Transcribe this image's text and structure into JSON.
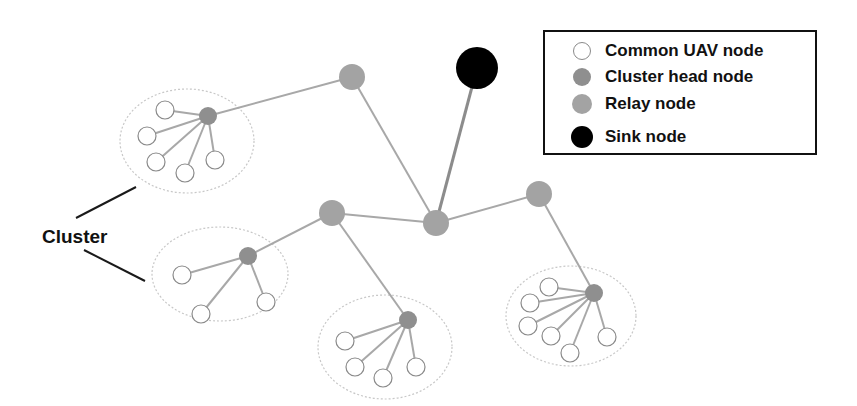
{
  "colors": {
    "common_fill": "#ffffff",
    "common_stroke": "#8a8a8a",
    "head_fill": "#8f8f8f",
    "relay_fill": "#a3a3a3",
    "sink_fill": "#000000",
    "link": "#a8a8a8",
    "sink_link": "#8c8c8c",
    "ellipse": "#c8c8c8",
    "pointer": "#1a1a1a"
  },
  "legend": {
    "items": [
      {
        "label": "Common UAV node",
        "type": "common",
        "y": 7
      },
      {
        "label": "Cluster head node",
        "type": "head",
        "y": 33
      },
      {
        "label": "Relay node",
        "type": "relay",
        "y": 60
      },
      {
        "label": "Sink node",
        "type": "sink",
        "y": 93
      }
    ]
  },
  "cluster_label": {
    "text": "Cluster",
    "pointers": [
      {
        "x1": 76,
        "y1": 218,
        "x2": 136,
        "y2": 187
      },
      {
        "x1": 84,
        "y1": 250,
        "x2": 145,
        "y2": 281
      }
    ]
  },
  "sink": {
    "x": 477,
    "y": 68,
    "r": 21
  },
  "relays": [
    {
      "id": "R1",
      "x": 352,
      "y": 77,
      "r": 13
    },
    {
      "id": "R2",
      "x": 332,
      "y": 213,
      "r": 13
    },
    {
      "id": "R3",
      "x": 436,
      "y": 223,
      "r": 13
    },
    {
      "id": "R4",
      "x": 539,
      "y": 194,
      "r": 13
    }
  ],
  "backbone_links": [
    {
      "from": "R3",
      "to": "sink",
      "sink": true
    },
    {
      "from": "R3",
      "to": "R1"
    },
    {
      "from": "R3",
      "to": "R2"
    },
    {
      "from": "R3",
      "to": "R4"
    },
    {
      "from": "C1",
      "to": "R1"
    },
    {
      "from": "C2",
      "to": "R2"
    },
    {
      "from": "C3",
      "to": "R2"
    },
    {
      "from": "C4",
      "to": "R4"
    }
  ],
  "clusters": [
    {
      "id": "C1",
      "ellipse": {
        "cx": 187,
        "cy": 141,
        "rx": 67,
        "ry": 52
      },
      "head": {
        "x": 208,
        "y": 116,
        "r": 9
      },
      "members": [
        {
          "x": 165,
          "y": 110
        },
        {
          "x": 147,
          "y": 136
        },
        {
          "x": 156,
          "y": 162
        },
        {
          "x": 185,
          "y": 173
        },
        {
          "x": 215,
          "y": 160
        }
      ]
    },
    {
      "id": "C2",
      "ellipse": {
        "cx": 220,
        "cy": 274,
        "rx": 68,
        "ry": 47
      },
      "head": {
        "x": 248,
        "y": 256,
        "r": 9
      },
      "members": [
        {
          "x": 182,
          "y": 275
        },
        {
          "x": 201,
          "y": 314
        },
        {
          "x": 266,
          "y": 302
        }
      ]
    },
    {
      "id": "C3",
      "ellipse": {
        "cx": 385,
        "cy": 347,
        "rx": 67,
        "ry": 52
      },
      "head": {
        "x": 408,
        "y": 320,
        "r": 9
      },
      "members": [
        {
          "x": 345,
          "y": 341
        },
        {
          "x": 355,
          "y": 367
        },
        {
          "x": 383,
          "y": 378
        },
        {
          "x": 416,
          "y": 367
        }
      ]
    },
    {
      "id": "C4",
      "ellipse": {
        "cx": 571,
        "cy": 316,
        "rx": 65,
        "ry": 50
      },
      "head": {
        "x": 594,
        "y": 293,
        "r": 9
      },
      "members": [
        {
          "x": 549,
          "y": 287
        },
        {
          "x": 530,
          "y": 303
        },
        {
          "x": 528,
          "y": 326
        },
        {
          "x": 551,
          "y": 336
        },
        {
          "x": 570,
          "y": 353
        },
        {
          "x": 607,
          "y": 337
        }
      ]
    }
  ],
  "member_radius": 9
}
